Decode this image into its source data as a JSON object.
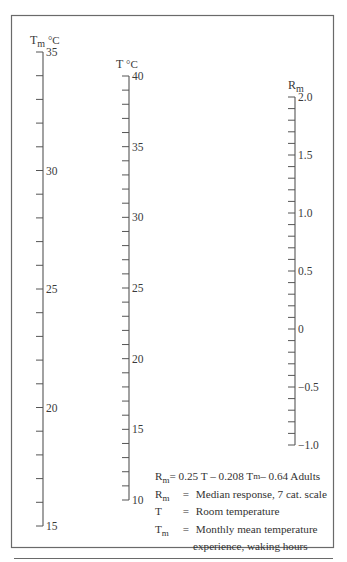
{
  "chart_data": {
    "type": "nomogram",
    "title": "",
    "frame": {
      "left": 11,
      "top": 15,
      "right": 333,
      "bottom": 547,
      "rule_y": 558
    },
    "scales": [
      {
        "id": "tm",
        "label_main": "T",
        "label_sub": "m",
        "label_unit": " °C",
        "x": 43,
        "y_top": 52,
        "y_bottom": 526,
        "max": 35,
        "min": 15,
        "minor_step": 1,
        "major_labels": [
          35,
          30,
          25,
          20,
          15
        ],
        "tick_side": "left"
      },
      {
        "id": "t",
        "label_main": "T",
        "label_sub": "",
        "label_unit": " °C",
        "x": 129,
        "y_top": 76,
        "y_bottom": 500,
        "max": 40,
        "min": 10,
        "minor_step": 1,
        "major_labels": [
          40,
          35,
          30,
          25,
          20,
          15,
          10
        ],
        "tick_side": "left"
      },
      {
        "id": "rm",
        "label_main": "R",
        "label_sub": "m",
        "label_unit": "",
        "x": 295,
        "y_top": 97,
        "y_bottom": 445,
        "max": 2.0,
        "min": -1.0,
        "minor_step": 0.1,
        "major_labels": [
          "2.0",
          "1.5",
          "1.0",
          "0.5",
          "0",
          "−0.5",
          "−1.0"
        ],
        "tick_side": "left"
      }
    ],
    "equation": "Rm = 0.25 T − 0.208 Tm − 0.64 Adults",
    "coefficients": {
      "T": 0.25,
      "Tm": -0.208,
      "constant": -0.64,
      "population": "Adults"
    }
  },
  "legend": {
    "equation": {
      "lhs_main": "R",
      "lhs_sub": "m",
      "rhs_part1": " = 0.25 T – 0.208 T",
      "rhs_sub": "m",
      "rhs_part2": " – 0.64 Adults"
    },
    "definitions": [
      {
        "sym_main": "R",
        "sym_sub": "m",
        "text": "Median response, 7 cat. scale"
      },
      {
        "sym_main": "T",
        "sym_sub": "",
        "text": "Room temperature"
      },
      {
        "sym_main": "T",
        "sym_sub": "m",
        "text": "Monthly mean temperature"
      }
    ],
    "continuation": "experience, waking hours",
    "equals": "="
  }
}
